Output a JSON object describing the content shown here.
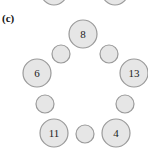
{
  "panel_label": "(c)",
  "colors": {
    "node_fill": "#e6e6e6",
    "node_stroke": "#9a9a9a",
    "background": "#ffffff"
  },
  "partial_nodes_top": [
    {
      "cx": 54,
      "cy": -8,
      "r": 13
    },
    {
      "cx": 115,
      "cy": -8,
      "r": 13
    }
  ],
  "large_nodes": [
    {
      "label": "8",
      "cx": 83,
      "cy": 34,
      "r": 14
    },
    {
      "label": "6",
      "cx": 37,
      "cy": 73,
      "r": 14
    },
    {
      "label": "13",
      "cx": 134,
      "cy": 73,
      "r": 14
    },
    {
      "label": "11",
      "cx": 54,
      "cy": 133,
      "r": 14
    },
    {
      "label": "4",
      "cx": 116,
      "cy": 133,
      "r": 14
    }
  ],
  "small_nodes": [
    {
      "cx": 61,
      "cy": 54,
      "r": 9
    },
    {
      "cx": 109,
      "cy": 54,
      "r": 9
    },
    {
      "cx": 45,
      "cy": 104,
      "r": 9
    },
    {
      "cx": 125,
      "cy": 104,
      "r": 9
    },
    {
      "cx": 85,
      "cy": 134,
      "r": 9
    }
  ]
}
